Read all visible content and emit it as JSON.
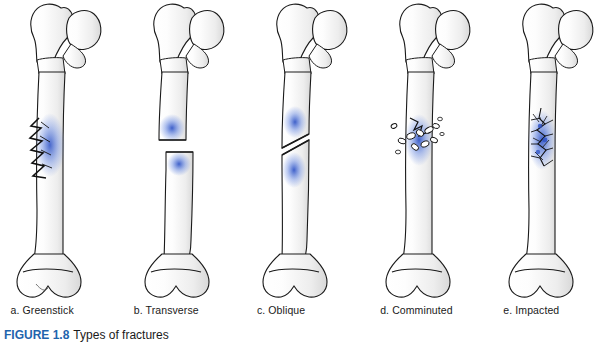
{
  "figure": {
    "caption_label": "FIGURE 1.8",
    "caption_text": "Types of fractures",
    "caption_accent_color": "#1f64ad",
    "bone_outline_color": "#1a1a1a",
    "bone_fill_color": "#fdfdfd",
    "marrow_accent_color": "#2a4fc4",
    "shading_color": "#8a8a8a"
  },
  "panels": [
    {
      "id": "greenstick",
      "letter": "a.",
      "name": "Greenstick",
      "label": "a. Greenstick",
      "description": "Incomplete fracture with jagged partial cracks along one side of the shaft"
    },
    {
      "id": "transverse",
      "letter": "b.",
      "name": "Transverse",
      "label": "b. Transverse",
      "description": "Complete horizontal break across the shaft with displaced distal segment"
    },
    {
      "id": "oblique",
      "letter": "c.",
      "name": "Oblique",
      "label": "c. Oblique",
      "description": "Complete break running diagonally across the shaft"
    },
    {
      "id": "comminuted",
      "letter": "d.",
      "name": "Comminuted",
      "label": "d. Comminuted",
      "description": "Bone shattered into multiple scattered fragments at the break site"
    },
    {
      "id": "impacted",
      "letter": "e.",
      "name": "Impacted",
      "label": "e. Impacted",
      "description": "Broken ends driven together producing a crushed compacted zone"
    }
  ]
}
